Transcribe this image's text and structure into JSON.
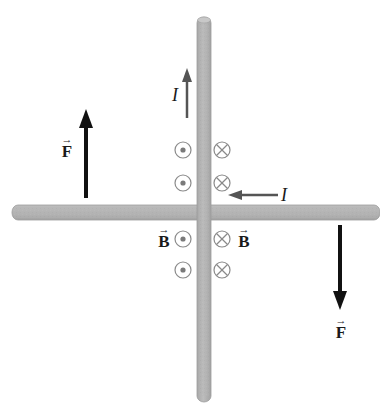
{
  "diagram": {
    "title": "",
    "colors": {
      "rod_fill": "#b3b3b3",
      "rod_edge": "#9a9a9a",
      "force_arrow": "#111111",
      "current_arrow": "#555555",
      "field_symbol": "#888888",
      "text": "#1a1a1a"
    },
    "rods": [
      {
        "name": "vertical-wire",
        "orientation": "vertical"
      },
      {
        "name": "horizontal-wire",
        "orientation": "horizontal"
      }
    ],
    "labels": {
      "current_vertical": "I",
      "current_horizontal": "I",
      "force_left": "F",
      "force_right": "F",
      "field_left": "B",
      "field_right": "B",
      "vector_arrow": "→"
    },
    "field_symbols": {
      "left_column": "out-of-page (dot)",
      "right_column": "into-page (cross)",
      "count_per_column": 4
    },
    "arrows": {
      "force_left_direction": "up",
      "force_right_direction": "down",
      "current_vertical_direction": "up",
      "current_horizontal_direction": "left"
    }
  }
}
